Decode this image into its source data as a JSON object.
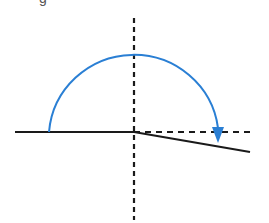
{
  "diagram": {
    "title": "",
    "clipped_glyph": "g",
    "colors": {
      "background": "#ffffff",
      "axis": "#1a1a1a",
      "arc": "#2a7fd4",
      "glyph": "#555555"
    },
    "origin": {
      "x": 134,
      "y": 132
    },
    "vertical_axis": {
      "style": "dashed",
      "x": 134,
      "y1": 18,
      "y2": 220
    },
    "initial_ray": {
      "style": "solid",
      "x1": 15,
      "y1": 132,
      "x2": 134,
      "y2": 132
    },
    "reference_ray": {
      "style": "dashed",
      "x1": 134,
      "y1": 132,
      "x2": 254,
      "y2": 132
    },
    "terminal_ray": {
      "style": "solid",
      "x1": 134,
      "y1": 132,
      "x2": 250,
      "y2": 152
    },
    "rotation_arc": {
      "direction": "clockwise",
      "center_x": 134,
      "center_y": 132,
      "radius": 85,
      "start": {
        "x": 49,
        "y": 132
      },
      "end": {
        "x": 218,
        "y": 130
      },
      "arrowhead_tip": {
        "x": 218,
        "y": 142
      }
    }
  }
}
